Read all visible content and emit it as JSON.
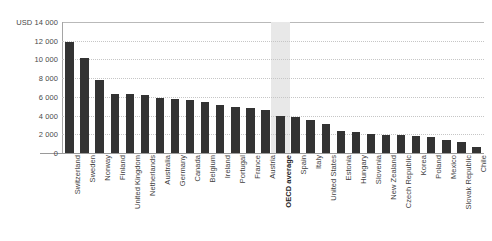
{
  "chart_data": {
    "type": "bar",
    "title": "",
    "subtitle": "",
    "xlabel": "",
    "ylabel": "USD",
    "ylim": [
      0,
      14000
    ],
    "ytick_values": [
      0,
      2000,
      4000,
      6000,
      8000,
      10000,
      12000,
      14000
    ],
    "ytick_labels": [
      "0",
      "2 000",
      "4 000",
      "6 000",
      "8 000",
      "10 000",
      "12 000",
      "USD 14 000"
    ],
    "grid": true,
    "legend": "none",
    "bar_color": "#333333",
    "highlight_color": "#e8e8e8",
    "highlight_category": "OECD average",
    "categories": [
      "Switzerland",
      "Sweden",
      "Norway",
      "Finland",
      "United Kingdom",
      "Netherlands",
      "Australia",
      "Germany",
      "Canada",
      "Belgium",
      "Ireland",
      "Portugal",
      "France",
      "Austria",
      "OECD average",
      "Spain",
      "Italy",
      "United States",
      "Estonia",
      "Hungary",
      "Slovenia",
      "New Zealand",
      "Czech Republic",
      "Korea",
      "Poland",
      "Mexico",
      "Slovak Republic",
      "Chile"
    ],
    "values": [
      11870,
      10200,
      7800,
      6300,
      6280,
      6220,
      5900,
      5750,
      5700,
      5500,
      5100,
      4900,
      4800,
      4650,
      3950,
      3900,
      3500,
      3150,
      2350,
      2200,
      2050,
      1950,
      1900,
      1800,
      1700,
      1400,
      1200,
      600
    ]
  },
  "top_remnant": {
    "fragments": [
      "",
      "",
      "",
      "",
      ""
    ]
  }
}
